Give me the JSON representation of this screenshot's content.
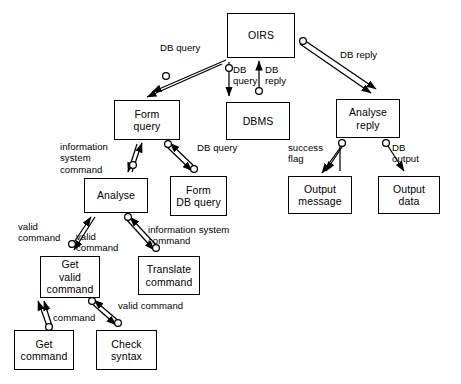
{
  "diagram": {
    "type": "data-flow-diagram",
    "stroke_color": "#000000",
    "background_color": "#ffffff",
    "nodes": [
      {
        "id": "oirs",
        "label": "OIRS",
        "x": 227,
        "y": 13,
        "w": 68,
        "h": 45
      },
      {
        "id": "form-query",
        "label": "Form\nquery",
        "x": 114,
        "y": 100,
        "w": 66,
        "h": 40
      },
      {
        "id": "dbms",
        "label": "DBMS",
        "x": 226,
        "y": 102,
        "w": 64,
        "h": 38
      },
      {
        "id": "analyse-reply",
        "label": "Analyse\nreply",
        "x": 336,
        "y": 99,
        "w": 64,
        "h": 39
      },
      {
        "id": "analyse",
        "label": "Analyse",
        "x": 84,
        "y": 178,
        "w": 64,
        "h": 35
      },
      {
        "id": "form-db-query",
        "label": "Form\nDB query",
        "x": 170,
        "y": 176,
        "w": 57,
        "h": 40
      },
      {
        "id": "output-message",
        "label": "Output\nmessage",
        "x": 288,
        "y": 176,
        "w": 64,
        "h": 38
      },
      {
        "id": "output-data",
        "label": "Output\ndata",
        "x": 378,
        "y": 176,
        "w": 62,
        "h": 38
      },
      {
        "id": "get-valid-command",
        "label": "Get\nvalid\ncommand",
        "x": 40,
        "y": 256,
        "w": 60,
        "h": 42
      },
      {
        "id": "translate-command",
        "label": "Translate\ncommand",
        "x": 138,
        "y": 256,
        "w": 62,
        "h": 39
      },
      {
        "id": "get-command",
        "label": "Get\ncommand",
        "x": 14,
        "y": 330,
        "w": 60,
        "h": 40
      },
      {
        "id": "check-syntax",
        "label": "Check\nsyntax",
        "x": 96,
        "y": 330,
        "w": 61,
        "h": 40
      }
    ],
    "edge_labels": [
      {
        "id": "db-query-1",
        "text": "DB query",
        "x": 160,
        "y": 42,
        "w": 56,
        "align": "left"
      },
      {
        "id": "db-query-2",
        "text": "DB\nquery",
        "x": 233,
        "y": 64,
        "w": 34,
        "align": "left"
      },
      {
        "id": "db-reply-1",
        "text": "DB\nreply",
        "x": 265,
        "y": 64,
        "w": 34,
        "align": "left"
      },
      {
        "id": "db-reply-2",
        "text": "DB reply",
        "x": 340,
        "y": 49,
        "w": 56,
        "align": "left"
      },
      {
        "id": "information-system-command-1",
        "text": "information\nsystem\ncommand",
        "x": 60,
        "y": 141,
        "w": 62,
        "align": "left"
      },
      {
        "id": "db-query-3",
        "text": "DB query",
        "x": 197,
        "y": 142,
        "w": 56,
        "align": "left"
      },
      {
        "id": "success-flag",
        "text": "success\nflag",
        "x": 288,
        "y": 142,
        "w": 46,
        "align": "left"
      },
      {
        "id": "db-output",
        "text": "DB\noutput",
        "x": 392,
        "y": 142,
        "w": 40,
        "align": "left"
      },
      {
        "id": "valid-command-1",
        "text": "valid\ncommand",
        "x": 18,
        "y": 221,
        "w": 60,
        "align": "left"
      },
      {
        "id": "valid-command-2",
        "text": "valid\ncommand",
        "x": 76,
        "y": 231,
        "w": 60,
        "align": "left"
      },
      {
        "id": "information-system-command-2",
        "text": "information system\ncommand",
        "x": 148,
        "y": 224,
        "w": 90,
        "align": "left"
      },
      {
        "id": "valid-command-3",
        "text": "valid command",
        "x": 118,
        "y": 300,
        "w": 86,
        "align": "left"
      },
      {
        "id": "command",
        "text": "command",
        "x": 53,
        "y": 312,
        "w": 56,
        "align": "left"
      }
    ]
  }
}
